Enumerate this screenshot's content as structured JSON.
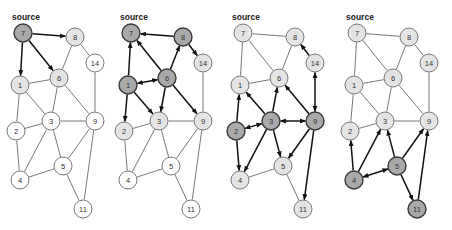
{
  "source_label": "source",
  "colors": {
    "dark": "#a9a9a9",
    "light": "#e4e4e4",
    "white": "#ffffff",
    "stroke_dark": "#3a3a3a",
    "stroke_light": "#6a6a6a",
    "edge_plain": "#555555",
    "edge_arrow": "#111111"
  },
  "nodes": {
    "7": [
      23,
      33
    ],
    "8": [
      75,
      37
    ],
    "14": [
      95,
      63
    ],
    "1": [
      20,
      85
    ],
    "6": [
      59,
      78
    ],
    "2": [
      16,
      131
    ],
    "3": [
      51,
      121
    ],
    "9": [
      95,
      121
    ],
    "5": [
      63,
      166
    ],
    "4": [
      20,
      180
    ],
    "11": [
      83,
      209
    ]
  },
  "node_radius": 9,
  "panels": [
    {
      "offset_x": 0,
      "node_styles": {
        "7": "dark",
        "8": "light",
        "1": "light",
        "6": "light",
        "14": "white",
        "2": "white",
        "3": "white",
        "9": "white",
        "5": "white",
        "4": "white",
        "11": "white"
      },
      "edges": [
        {
          "a": "7",
          "b": "8",
          "type": "forward"
        },
        {
          "a": "7",
          "b": "1",
          "type": "forward"
        },
        {
          "a": "7",
          "b": "6",
          "type": "forward"
        },
        {
          "a": "8",
          "b": "6",
          "type": "plain"
        },
        {
          "a": "8",
          "b": "14",
          "type": "plain"
        },
        {
          "a": "1",
          "b": "6",
          "type": "plain"
        },
        {
          "a": "1",
          "b": "3",
          "type": "plain"
        },
        {
          "a": "1",
          "b": "2",
          "type": "plain"
        },
        {
          "a": "6",
          "b": "3",
          "type": "plain"
        },
        {
          "a": "6",
          "b": "9",
          "type": "plain"
        },
        {
          "a": "14",
          "b": "9",
          "type": "plain"
        },
        {
          "a": "2",
          "b": "3",
          "type": "plain"
        },
        {
          "a": "2",
          "b": "4",
          "type": "plain"
        },
        {
          "a": "3",
          "b": "9",
          "type": "plain"
        },
        {
          "a": "3",
          "b": "4",
          "type": "plain"
        },
        {
          "a": "3",
          "b": "5",
          "type": "plain"
        },
        {
          "a": "9",
          "b": "5",
          "type": "plain"
        },
        {
          "a": "5",
          "b": "4",
          "type": "plain"
        },
        {
          "a": "5",
          "b": "11",
          "type": "plain"
        },
        {
          "a": "9",
          "b": "11",
          "type": "plain"
        }
      ]
    },
    {
      "offset_x": 108,
      "node_styles": {
        "7": "dark",
        "8": "dark",
        "1": "dark",
        "6": "dark",
        "14": "light",
        "2": "light",
        "3": "light",
        "9": "light",
        "5": "white",
        "4": "white",
        "11": "white"
      },
      "edges": [
        {
          "a": "8",
          "b": "7",
          "type": "forward"
        },
        {
          "a": "1",
          "b": "7",
          "type": "forward"
        },
        {
          "a": "6",
          "b": "7",
          "type": "forward"
        },
        {
          "a": "6",
          "b": "8",
          "type": "forward"
        },
        {
          "a": "8",
          "b": "14",
          "type": "forward"
        },
        {
          "a": "6",
          "b": "1",
          "type": "both"
        },
        {
          "a": "1",
          "b": "2",
          "type": "forward"
        },
        {
          "a": "1",
          "b": "3",
          "type": "forward"
        },
        {
          "a": "6",
          "b": "3",
          "type": "forward"
        },
        {
          "a": "6",
          "b": "9",
          "type": "forward"
        },
        {
          "a": "14",
          "b": "9",
          "type": "plain"
        },
        {
          "a": "2",
          "b": "3",
          "type": "plain"
        },
        {
          "a": "2",
          "b": "4",
          "type": "plain"
        },
        {
          "a": "3",
          "b": "9",
          "type": "plain"
        },
        {
          "a": "3",
          "b": "4",
          "type": "plain"
        },
        {
          "a": "3",
          "b": "5",
          "type": "plain"
        },
        {
          "a": "9",
          "b": "5",
          "type": "plain"
        },
        {
          "a": "5",
          "b": "4",
          "type": "plain"
        },
        {
          "a": "5",
          "b": "11",
          "type": "plain"
        },
        {
          "a": "9",
          "b": "11",
          "type": "plain"
        }
      ]
    },
    {
      "offset_x": 220,
      "node_styles": {
        "7": "light",
        "8": "light",
        "1": "light",
        "6": "light",
        "14": "light",
        "2": "dark",
        "3": "dark",
        "9": "dark",
        "5": "light",
        "4": "light",
        "11": "light"
      },
      "edges": [
        {
          "a": "7",
          "b": "8",
          "type": "plain"
        },
        {
          "a": "7",
          "b": "6",
          "type": "plain"
        },
        {
          "a": "7",
          "b": "1",
          "type": "plain"
        },
        {
          "a": "8",
          "b": "6",
          "type": "plain"
        },
        {
          "a": "1",
          "b": "6",
          "type": "plain"
        },
        {
          "a": "14",
          "b": "8",
          "type": "forward"
        },
        {
          "a": "14",
          "b": "9",
          "type": "both"
        },
        {
          "a": "2",
          "b": "1",
          "type": "forward"
        },
        {
          "a": "3",
          "b": "1",
          "type": "forward"
        },
        {
          "a": "3",
          "b": "6",
          "type": "forward"
        },
        {
          "a": "9",
          "b": "6",
          "type": "forward"
        },
        {
          "a": "3",
          "b": "2",
          "type": "both"
        },
        {
          "a": "3",
          "b": "9",
          "type": "both"
        },
        {
          "a": "2",
          "b": "4",
          "type": "forward"
        },
        {
          "a": "3",
          "b": "4",
          "type": "forward"
        },
        {
          "a": "3",
          "b": "5",
          "type": "forward"
        },
        {
          "a": "9",
          "b": "5",
          "type": "forward"
        },
        {
          "a": "9",
          "b": "11",
          "type": "forward"
        },
        {
          "a": "5",
          "b": "4",
          "type": "plain"
        },
        {
          "a": "5",
          "b": "11",
          "type": "plain"
        }
      ]
    },
    {
      "offset_x": 334,
      "node_styles": {
        "7": "light",
        "8": "light",
        "1": "light",
        "6": "light",
        "14": "light",
        "2": "light",
        "3": "light",
        "9": "light",
        "5": "dark",
        "4": "dark",
        "11": "dark"
      },
      "edges": [
        {
          "a": "7",
          "b": "8",
          "type": "plain"
        },
        {
          "a": "7",
          "b": "6",
          "type": "plain"
        },
        {
          "a": "7",
          "b": "1",
          "type": "plain"
        },
        {
          "a": "8",
          "b": "6",
          "type": "plain"
        },
        {
          "a": "8",
          "b": "14",
          "type": "plain"
        },
        {
          "a": "1",
          "b": "6",
          "type": "plain"
        },
        {
          "a": "1",
          "b": "3",
          "type": "plain"
        },
        {
          "a": "1",
          "b": "2",
          "type": "plain"
        },
        {
          "a": "6",
          "b": "3",
          "type": "plain"
        },
        {
          "a": "6",
          "b": "9",
          "type": "plain"
        },
        {
          "a": "14",
          "b": "9",
          "type": "plain"
        },
        {
          "a": "2",
          "b": "3",
          "type": "plain"
        },
        {
          "a": "3",
          "b": "9",
          "type": "plain"
        },
        {
          "a": "4",
          "b": "2",
          "type": "forward"
        },
        {
          "a": "4",
          "b": "3",
          "type": "forward"
        },
        {
          "a": "5",
          "b": "3",
          "type": "forward"
        },
        {
          "a": "5",
          "b": "9",
          "type": "forward"
        },
        {
          "a": "5",
          "b": "4",
          "type": "both"
        },
        {
          "a": "5",
          "b": "11",
          "type": "forward"
        },
        {
          "a": "11",
          "b": "9",
          "type": "forward"
        }
      ]
    }
  ]
}
